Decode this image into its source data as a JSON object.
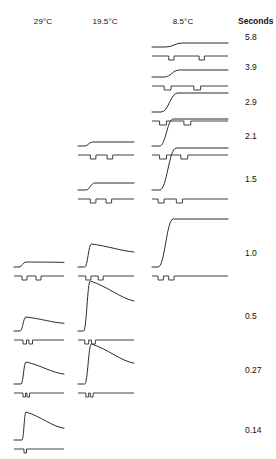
{
  "figure": {
    "title_unit": "Seconds",
    "columns": [
      {
        "id": "c29",
        "label": "29°C",
        "x": 43
      },
      {
        "id": "c195",
        "label": "19.5°C",
        "x": 105
      },
      {
        "id": "c85",
        "label": "8.5°C",
        "x": 183
      }
    ],
    "unit_label_x": 238,
    "unit_label_y": 16,
    "header_y": 17,
    "rows": [
      {
        "id": "r58",
        "label": "5.8",
        "label_x": 245,
        "label_y": 32,
        "baseline_y": 47
      },
      {
        "id": "r39",
        "label": "3.9",
        "label_x": 245,
        "label_y": 62,
        "baseline_y": 77
      },
      {
        "id": "r29",
        "label": "2.9",
        "label_x": 245,
        "label_y": 97,
        "baseline_y": 112
      },
      {
        "id": "r21",
        "label": "2.1",
        "label_x": 245,
        "label_y": 131,
        "baseline_y": 146
      },
      {
        "id": "r15",
        "label": "1.5",
        "label_x": 245,
        "label_y": 174,
        "baseline_y": 190
      },
      {
        "id": "r10",
        "label": "1.0",
        "label_x": 245,
        "label_y": 248,
        "baseline_y": 267
      },
      {
        "id": "r05",
        "label": "0.5",
        "label_x": 245,
        "label_y": 311,
        "baseline_y": 331
      },
      {
        "id": "r027",
        "label": "0.27",
        "label_x": 245,
        "label_y": 365,
        "baseline_y": 384
      },
      {
        "id": "r014",
        "label": "0.14",
        "label_x": 245,
        "label_y": 425,
        "baseline_y": 440
      }
    ]
  },
  "chart_data": {
    "type": "line",
    "title": "",
    "xlabel": "",
    "ylabel": "",
    "legend": "none",
    "grid": false,
    "temperatures": [
      "29°C",
      "19.5°C",
      "8.5°C"
    ],
    "durations_seconds": [
      5.8,
      3.9,
      2.9,
      2.1,
      1.5,
      1.0,
      0.5,
      0.27,
      0.14
    ],
    "cells": [
      {
        "row": "5.8",
        "column": "8.5°C",
        "x": 152,
        "width": 76,
        "amplitude": 4,
        "rise": 0.6,
        "rise_len": 0.22,
        "decay": 0.0,
        "onset": 0.18,
        "marker_notches": [
          0.22,
          0.62
        ],
        "notch_width": 0.07
      },
      {
        "row": "3.9",
        "column": "8.5°C",
        "x": 152,
        "width": 76,
        "amplitude": 7,
        "rise": 0.55,
        "rise_len": 0.2,
        "decay": 0.0,
        "onset": 0.16,
        "marker_notches": [
          0.16,
          0.55
        ],
        "notch_width": 0.09
      },
      {
        "row": "2.9",
        "column": "8.5°C",
        "x": 152,
        "width": 76,
        "amplitude": 19,
        "rise": 0.46,
        "rise_len": 0.22,
        "decay": 0.0,
        "onset": 0.12,
        "marker_notches": [
          0.1,
          0.42
        ],
        "notch_width": 0.09
      },
      {
        "row": "2.1",
        "column": "19.5°C",
        "x": 78,
        "width": 56,
        "amplitude": 4,
        "rise": 0.48,
        "rise_len": 0.14,
        "decay": 0.0,
        "onset": 0.12,
        "marker_notches": [
          0.22,
          0.52
        ],
        "notch_width": 0.1
      },
      {
        "row": "2.1",
        "column": "8.5°C",
        "x": 152,
        "width": 76,
        "amplitude": 27,
        "rise": 0.34,
        "rise_len": 0.18,
        "decay": 0.0,
        "onset": 0.1,
        "marker_notches": [
          0.1,
          0.38
        ],
        "notch_width": 0.09
      },
      {
        "row": "1.5",
        "column": "19.5°C",
        "x": 78,
        "width": 56,
        "amplitude": 7,
        "rise": 0.46,
        "rise_len": 0.16,
        "decay": 0.0,
        "onset": 0.14,
        "marker_notches": [
          0.22,
          0.5
        ],
        "notch_width": 0.1
      },
      {
        "row": "1.5",
        "column": "8.5°C",
        "x": 152,
        "width": 76,
        "amplitude": 42,
        "rise": 0.3,
        "rise_len": 0.22,
        "decay": 0.0,
        "onset": 0.1,
        "marker_notches": [
          0.08,
          0.32
        ],
        "notch_width": 0.08
      },
      {
        "row": "1.0",
        "column": "29°C",
        "x": 14,
        "width": 50,
        "amplitude": 5,
        "rise": 0.42,
        "rise_len": 0.14,
        "decay": 0.08,
        "onset": 0.1,
        "marker_notches": [
          0.16,
          0.44
        ],
        "notch_width": 0.1
      },
      {
        "row": "1.0",
        "column": "19.5°C",
        "x": 78,
        "width": 56,
        "amplitude": 23,
        "rise": 0.34,
        "rise_len": 0.12,
        "decay": 0.35,
        "onset": 0.12,
        "marker_notches": [
          0.14,
          0.36
        ],
        "notch_width": 0.09
      },
      {
        "row": "1.0",
        "column": "8.5°C",
        "x": 152,
        "width": 76,
        "amplitude": 48,
        "rise": 0.22,
        "rise_len": 0.2,
        "decay": 0.0,
        "onset": 0.08,
        "marker_notches": [
          0.08,
          0.22
        ],
        "notch_width": 0.07
      },
      {
        "row": "0.5",
        "column": "29°C",
        "x": 14,
        "width": 50,
        "amplitude": 14,
        "rise": 0.32,
        "rise_len": 0.12,
        "decay": 0.45,
        "onset": 0.12,
        "marker_notches": [
          0.18,
          0.3
        ],
        "notch_width": 0.07
      },
      {
        "row": "0.5",
        "column": "19.5°C",
        "x": 78,
        "width": 56,
        "amplitude": 50,
        "rise": 0.22,
        "rise_len": 0.12,
        "decay": 0.4,
        "onset": 0.1,
        "marker_notches": [
          0.12,
          0.24
        ],
        "notch_width": 0.07
      },
      {
        "row": "0.27",
        "column": "29°C",
        "x": 14,
        "width": 50,
        "amplitude": 22,
        "rise": 0.26,
        "rise_len": 0.1,
        "decay": 0.55,
        "onset": 0.14,
        "marker_notches": [
          0.18,
          0.26
        ],
        "notch_width": 0.05
      },
      {
        "row": "0.27",
        "column": "19.5°C",
        "x": 78,
        "width": 56,
        "amplitude": 40,
        "rise": 0.26,
        "rise_len": 0.12,
        "decay": 0.48,
        "onset": 0.12,
        "marker_notches": [
          0.14,
          0.22
        ],
        "notch_width": 0.05
      },
      {
        "row": "0.14",
        "column": "29°C",
        "x": 14,
        "width": 50,
        "amplitude": 28,
        "rise": 0.26,
        "rise_len": 0.08,
        "decay": 0.58,
        "onset": 0.16,
        "marker_notches": [
          0.2
        ],
        "notch_width": 0.05
      }
    ]
  }
}
